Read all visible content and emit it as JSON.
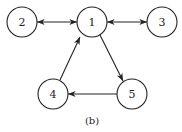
{
  "diagram": {
    "caption": "(b)",
    "nodes": [
      {
        "id": "1",
        "label": "1",
        "x": 92,
        "y": 22
      },
      {
        "id": "2",
        "label": "2",
        "x": 22,
        "y": 22
      },
      {
        "id": "3",
        "label": "3",
        "x": 162,
        "y": 22
      },
      {
        "id": "4",
        "label": "4",
        "x": 53,
        "y": 94
      },
      {
        "id": "5",
        "label": "5",
        "x": 132,
        "y": 94
      }
    ],
    "edges": [
      {
        "from": "2",
        "to": "1",
        "bidirectional": true
      },
      {
        "from": "1",
        "to": "3",
        "bidirectional": true
      },
      {
        "from": "1",
        "to": "5",
        "bidirectional": false
      },
      {
        "from": "5",
        "to": "4",
        "bidirectional": false
      },
      {
        "from": "4",
        "to": "1",
        "bidirectional": false
      }
    ]
  }
}
